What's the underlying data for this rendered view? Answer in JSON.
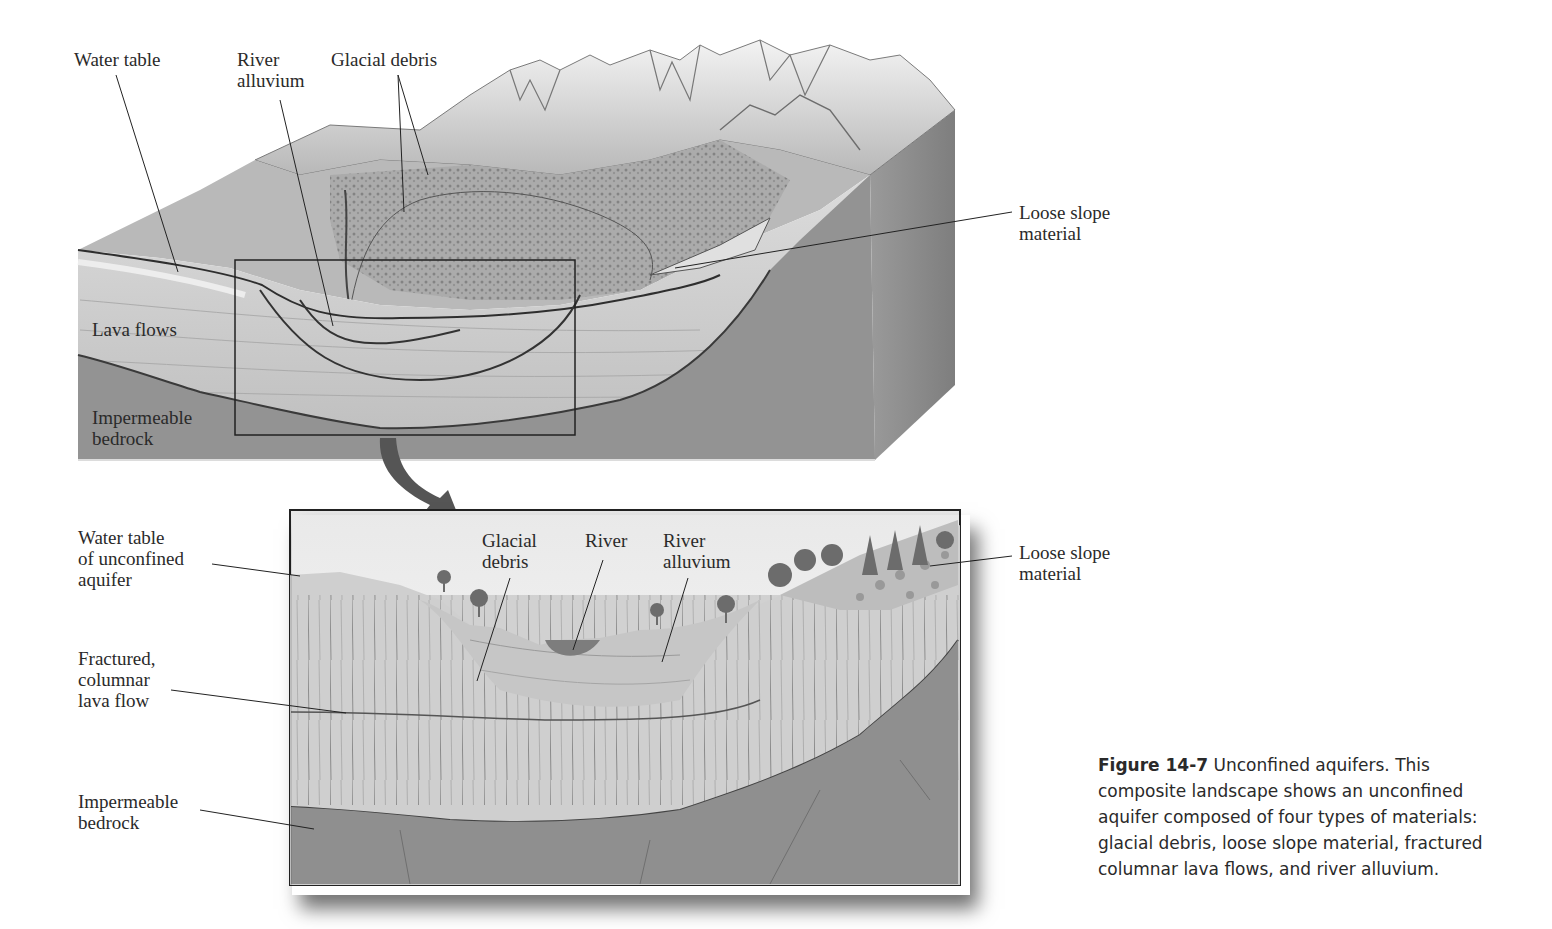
{
  "figure": {
    "caption_label": "Figure 14-7",
    "caption_text": " Unconfined aquifers. This composite landscape shows an unconfined aquifer composed of four types of materials: glacial debris, loose slope material, fractured columnar lava flows, and river alluvium."
  },
  "block_diagram": {
    "labels": {
      "water_table": "Water table",
      "river_alluvium": "River\nalluvium",
      "glacial_debris": "Glacial debris",
      "loose_slope": "Loose slope\nmaterial",
      "lava_flows": "Lava flows",
      "bedrock": "Impermeable\nbedrock"
    }
  },
  "inset": {
    "labels": {
      "water_table": "Water table\nof unconfined\naquifer",
      "fractured_lava": "Fractured,\ncolumnar\nlava flow",
      "bedrock": "Impermeable\nbedrock",
      "glacial_debris": "Glacial\ndebris",
      "river": "River",
      "river_alluvium": "River\nalluvium",
      "loose_slope": "Loose slope\nmaterial"
    }
  },
  "colors": {
    "bedrock": "#8f8f8f",
    "lava": "#c9c9c9",
    "sky": "#f2f2f2",
    "mountain": "#e4e4e4",
    "vegetation": "#9a9a9a",
    "river": "#7d7d7d"
  }
}
